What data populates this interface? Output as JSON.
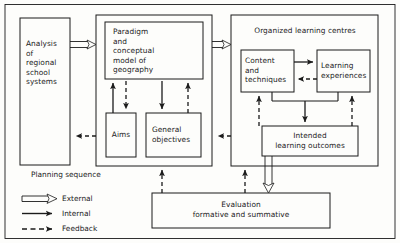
{
  "diagram": {
    "stroke_color": "#1b1b1b",
    "background_color": "#fdfdfb",
    "containers": [
      {
        "id": "paradigm-container",
        "label": ""
      },
      {
        "id": "organized-learning-centres",
        "label": "Organized learning centres"
      }
    ],
    "boxes": [
      {
        "id": "analysis",
        "label": "Analysis\nof\nregional\nschool\nsystems",
        "align": "left"
      },
      {
        "id": "paradigm",
        "label": "Paradigm\nand\nconceptual\nmodel of\ngeography",
        "align": "left"
      },
      {
        "id": "aims",
        "label": "Aims",
        "align": "center"
      },
      {
        "id": "general-objectives",
        "label": "General\nobjectives",
        "align": "left"
      },
      {
        "id": "content-techniques",
        "label": "Content\nand\ntechniques",
        "align": "left"
      },
      {
        "id": "learning-experiences",
        "label": "Learning\nexperiences",
        "align": "left"
      },
      {
        "id": "intended-learning-outcomes",
        "label": "Intended\nlearning outcomes",
        "align": "center"
      },
      {
        "id": "evaluation",
        "label": "Evaluation\nformative and summative",
        "align": "center"
      }
    ]
  },
  "legend": {
    "title": "Planning sequence",
    "items": [
      {
        "id": "external",
        "label": "External",
        "style": "hollow-arrow"
      },
      {
        "id": "internal",
        "label": "Internal",
        "style": "solid-arrow"
      },
      {
        "id": "feedback",
        "label": "Feedback",
        "style": "dashed-arrow"
      }
    ]
  }
}
